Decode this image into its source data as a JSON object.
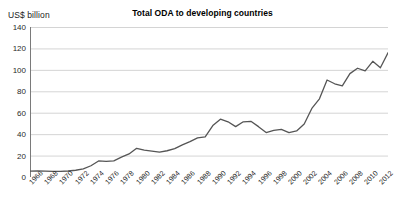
{
  "chart_data": {
    "type": "line",
    "title": "Total ODA to developing countries",
    "ylabel": "US$ billion",
    "xlabel": "",
    "ylim": [
      0,
      140
    ],
    "ytick_labels": [
      "140",
      "120",
      "100",
      "80",
      "60",
      "40",
      "20",
      "0"
    ],
    "ytick_values": [
      140,
      120,
      100,
      80,
      60,
      40,
      20,
      0
    ],
    "grid": true,
    "legend": "none",
    "x": [
      1966,
      1967,
      1968,
      1969,
      1970,
      1971,
      1972,
      1973,
      1974,
      1975,
      1976,
      1977,
      1978,
      1979,
      1980,
      1981,
      1982,
      1983,
      1984,
      1985,
      1986,
      1987,
      1988,
      1989,
      1990,
      1991,
      1992,
      1993,
      1994,
      1995,
      1996,
      1997,
      1998,
      1999,
      2000,
      2001,
      2002,
      2003,
      2004,
      2005,
      2006,
      2007,
      2008,
      2009,
      2010,
      2011,
      2012,
      2013
    ],
    "xtick_labels": [
      "1966",
      "1968",
      "1970",
      "1972",
      "1974",
      "1976",
      "1978",
      "1980",
      "1982",
      "1984",
      "1986",
      "1988",
      "1990",
      "1992",
      "1994",
      "1996",
      "1998",
      "2000",
      "2002",
      "2004",
      "2006",
      "2008",
      "2010",
      "2012"
    ],
    "values": [
      5.5,
      5.6,
      5.4,
      5.2,
      5.2,
      5.6,
      6.3,
      7.5,
      10.5,
      15.0,
      14.5,
      15.0,
      18.5,
      21.5,
      26.8,
      25.0,
      24.2,
      23.2,
      24.5,
      26.5,
      30.0,
      33.0,
      36.5,
      37.5,
      48.0,
      54.0,
      51.5,
      47.0,
      51.5,
      52.0,
      47.0,
      41.5,
      43.5,
      44.5,
      41.5,
      43.0,
      49.5,
      64.0,
      73.0,
      90.5,
      87.0,
      85.0,
      96.5,
      101.5,
      99.0,
      108.0,
      102.0,
      116.0
    ],
    "series_name": "Total ODA",
    "line_color": "#555555"
  },
  "colors": {
    "background": "#ffffff",
    "grid": "#c9c9c9",
    "axis": "#7a7a7a",
    "line": "#555555",
    "text": "#1a1a1a"
  }
}
